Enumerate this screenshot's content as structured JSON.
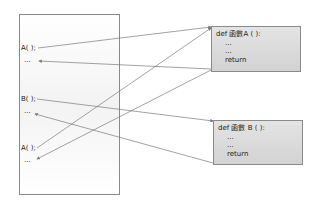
{
  "caller": {
    "lines": [
      "A( );",
      "...",
      "B( );",
      "...",
      "A( );",
      "..."
    ]
  },
  "functions": [
    {
      "header": "def 函數A ( ):",
      "body": [
        "...",
        "...",
        "return"
      ]
    },
    {
      "header": "def 函數 B ( ):",
      "body": [
        "...",
        "...",
        "return"
      ]
    }
  ],
  "colors": {
    "line": "#7a7a7a",
    "box_fill": "#dcdcdc",
    "border": "#8a8a8a"
  }
}
